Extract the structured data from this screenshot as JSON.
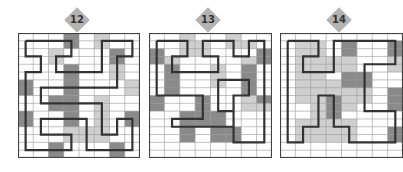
{
  "page": {
    "width": 369,
    "height": 172
  },
  "colors": {
    "dark": "#8a8a8a",
    "light": "#cfcfcf",
    "white": "#ffffff",
    "gridline": "#9a9a9a",
    "border": "#444444",
    "path": "#333333",
    "badge": "#b3b3b3",
    "badge_text": "#333333"
  },
  "puzzles": [
    {
      "number": "12",
      "x": 18,
      "y": 33,
      "w": 122,
      "h": 125,
      "badge": {
        "x": 64,
        "y": 7
      },
      "cols": 8,
      "rows": 16,
      "shading": [
        "00020100",
        "00020100",
        "00100020",
        "00100020",
        "00020010",
        "00020010",
        "20020001",
        "20020001",
        "00220100",
        "00220100",
        "20020102",
        "20020102",
        "00011100",
        "00011100",
        "00200020",
        "00200020"
      ],
      "path": [
        [
          0.5,
          1
        ],
        [
          3.5,
          1
        ],
        [
          3.5,
          3
        ],
        [
          2.5,
          3
        ],
        [
          2.5,
          5
        ],
        [
          5.5,
          5
        ],
        [
          5.5,
          1
        ],
        [
          7.5,
          1
        ],
        [
          7.5,
          3
        ],
        [
          6.5,
          3
        ],
        [
          6.5,
          7
        ],
        [
          1.5,
          7
        ],
        [
          1.5,
          9
        ],
        [
          5.5,
          9
        ],
        [
          5.5,
          13
        ],
        [
          6.5,
          13
        ],
        [
          6.5,
          11
        ],
        [
          7.5,
          11
        ],
        [
          7.5,
          15
        ],
        [
          4.5,
          15
        ],
        [
          4.5,
          11
        ],
        [
          1.5,
          11
        ],
        [
          1.5,
          13
        ],
        [
          3.5,
          13
        ],
        [
          3.5,
          15
        ],
        [
          0.5,
          15
        ],
        [
          0.5,
          5
        ],
        [
          1.5,
          5
        ],
        [
          1.5,
          3
        ],
        [
          0.5,
          3
        ],
        [
          0.5,
          1
        ]
      ]
    },
    {
      "number": "13",
      "x": 149,
      "y": 33,
      "w": 123,
      "h": 125,
      "badge": {
        "x": 195,
        "y": 7
      },
      "cols": 8,
      "rows": 16,
      "shading": [
        "00100100",
        "00110110",
        "20110002",
        "21000012",
        "02001020",
        "02001020",
        "02001020",
        "02000020",
        "20020012",
        "20020011",
        "00222000",
        "00222000",
        "00202200",
        "00202200",
        "00000000",
        "00000000"
      ],
      "path": [
        [
          0.5,
          1
        ],
        [
          2.5,
          1
        ],
        [
          2.5,
          3
        ],
        [
          1.5,
          3
        ],
        [
          1.5,
          5
        ],
        [
          4.5,
          5
        ],
        [
          4.5,
          3
        ],
        [
          3.5,
          3
        ],
        [
          3.5,
          1
        ],
        [
          5.5,
          1
        ],
        [
          5.5,
          3
        ],
        [
          6.5,
          3
        ],
        [
          6.5,
          1
        ],
        [
          7.5,
          1
        ],
        [
          7.5,
          14
        ],
        [
          5.5,
          14
        ],
        [
          5.5,
          8
        ],
        [
          6.5,
          8
        ],
        [
          6.5,
          6
        ],
        [
          4.5,
          6
        ],
        [
          4.5,
          10
        ],
        [
          5.5,
          10
        ],
        [
          5.5,
          12
        ],
        [
          1.5,
          12
        ],
        [
          1.5,
          11
        ],
        [
          3.5,
          11
        ],
        [
          3.5,
          8
        ],
        [
          0.5,
          8
        ],
        [
          0.5,
          1
        ]
      ]
    },
    {
      "number": "14",
      "x": 280,
      "y": 33,
      "w": 123,
      "h": 125,
      "badge": {
        "x": 326,
        "y": 7
      },
      "cols": 8,
      "rows": 16,
      "shading": [
        "00000000",
        "01102002",
        "01102002",
        "01111001",
        "01111001",
        "01102200",
        "01112200",
        "01111102",
        "01121102",
        "00121002",
        "00120000",
        "01111000",
        "01111002",
        "01111002",
        "00000000",
        "00000000"
      ],
      "path": [
        [
          0.5,
          1
        ],
        [
          2.5,
          1
        ],
        [
          2.5,
          3
        ],
        [
          1.5,
          3
        ],
        [
          1.5,
          5
        ],
        [
          3.5,
          5
        ],
        [
          3.5,
          1
        ],
        [
          7.5,
          1
        ],
        [
          7.5,
          4
        ],
        [
          5.5,
          4
        ],
        [
          5.5,
          10
        ],
        [
          7.5,
          10
        ],
        [
          7.5,
          14
        ],
        [
          4.5,
          14
        ],
        [
          4.5,
          12
        ],
        [
          3.5,
          12
        ],
        [
          3.5,
          8
        ],
        [
          2.5,
          8
        ],
        [
          2.5,
          12
        ],
        [
          1.5,
          12
        ],
        [
          1.5,
          14
        ],
        [
          0.5,
          14
        ],
        [
          0.5,
          1
        ]
      ]
    }
  ]
}
